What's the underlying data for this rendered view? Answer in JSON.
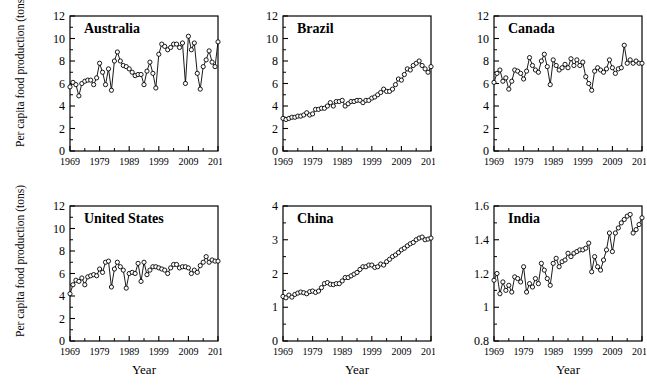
{
  "figure": {
    "type": "multi-panel-line-chart",
    "rows": 2,
    "cols": 3,
    "shared_ylabel": "Per capita food production (tons)",
    "shared_xlabel": "Year",
    "marker": "open-circle",
    "line_color": "#000000",
    "marker_fill": "#ffffff",
    "background": "#ffffff"
  },
  "chart_data": [
    {
      "type": "line",
      "title": "Australia",
      "xlabel": "Year",
      "ylabel": "Per capita food production (tons)",
      "xlim": [
        1969,
        2019
      ],
      "ylim": [
        0,
        12
      ],
      "yticks": [
        0,
        2,
        4,
        6,
        8,
        10,
        12
      ],
      "xticks": [
        1969,
        1979,
        1989,
        1999,
        2009,
        2019
      ],
      "xtick_labels": [
        "1969",
        "1979",
        "1989",
        "1999",
        "2009",
        "2019"
      ],
      "ytick_labels": [
        "0",
        "2",
        "4",
        "6",
        "8",
        "10",
        "12"
      ],
      "grid": false,
      "legend": "none",
      "x": [
        1969,
        1970,
        1971,
        1972,
        1973,
        1974,
        1975,
        1976,
        1977,
        1978,
        1979,
        1980,
        1981,
        1982,
        1983,
        1984,
        1985,
        1986,
        1987,
        1988,
        1989,
        1990,
        1991,
        1992,
        1993,
        1994,
        1995,
        1996,
        1997,
        1998,
        1999,
        2000,
        2001,
        2002,
        2003,
        2004,
        2005,
        2006,
        2007,
        2008,
        2009,
        2010,
        2011,
        2012,
        2013,
        2014,
        2015,
        2016,
        2017,
        2018,
        2019
      ],
      "values": [
        5.7,
        6.1,
        5.9,
        4.9,
        6.0,
        6.2,
        6.3,
        6.3,
        5.9,
        6.5,
        7.8,
        7.0,
        5.9,
        7.3,
        5.4,
        8.0,
        8.8,
        8.0,
        7.6,
        7.5,
        7.3,
        7.0,
        6.7,
        6.8,
        6.8,
        5.9,
        7.1,
        7.9,
        6.9,
        5.6,
        8.6,
        9.5,
        9.3,
        9.0,
        9.2,
        9.5,
        9.5,
        9.2,
        9.6,
        6.0,
        10.2,
        9.0,
        9.6,
        6.9,
        5.5,
        7.5,
        8.1,
        8.9,
        7.9,
        7.5,
        9.7
      ]
    },
    {
      "type": "line",
      "title": "Brazil",
      "xlabel": "Year",
      "ylabel": "Per capita food production (tons)",
      "xlim": [
        1969,
        2019
      ],
      "ylim": [
        0,
        12
      ],
      "yticks": [
        0,
        2,
        4,
        6,
        8,
        10,
        12
      ],
      "xticks": [
        1969,
        1979,
        1989,
        1999,
        2009,
        2019
      ],
      "xtick_labels": [
        "1969",
        "1979",
        "1989",
        "1999",
        "2009",
        "2019"
      ],
      "ytick_labels": [
        "0",
        "2",
        "4",
        "6",
        "8",
        "10",
        "12"
      ],
      "grid": false,
      "legend": "none",
      "x": [
        1969,
        1970,
        1971,
        1972,
        1973,
        1974,
        1975,
        1976,
        1977,
        1978,
        1979,
        1980,
        1981,
        1982,
        1983,
        1984,
        1985,
        1986,
        1987,
        1988,
        1989,
        1990,
        1991,
        1992,
        1993,
        1994,
        1995,
        1996,
        1997,
        1998,
        1999,
        2000,
        2001,
        2002,
        2003,
        2004,
        2005,
        2006,
        2007,
        2008,
        2009,
        2010,
        2011,
        2012,
        2013,
        2014,
        2015,
        2016,
        2017,
        2018,
        2019
      ],
      "values": [
        2.9,
        2.8,
        2.9,
        3.0,
        3.0,
        3.1,
        3.1,
        3.2,
        3.4,
        3.2,
        3.3,
        3.7,
        3.7,
        3.8,
        3.8,
        4.0,
        4.3,
        4.0,
        4.4,
        4.4,
        4.5,
        4.0,
        4.2,
        4.4,
        4.4,
        4.5,
        4.5,
        4.3,
        4.5,
        4.5,
        4.7,
        4.8,
        5.0,
        5.2,
        5.5,
        5.3,
        5.3,
        5.5,
        5.9,
        6.4,
        6.3,
        6.8,
        7.3,
        7.2,
        7.6,
        7.8,
        8.0,
        7.6,
        7.3,
        7.0,
        7.5
      ]
    },
    {
      "type": "line",
      "title": "Canada",
      "xlabel": "Year",
      "ylabel": "Per capita food production (tons)",
      "xlim": [
        1969,
        2019
      ],
      "ylim": [
        0,
        12
      ],
      "yticks": [
        0,
        2,
        4,
        6,
        8,
        10,
        12
      ],
      "xticks": [
        1969,
        1979,
        1989,
        1999,
        2009,
        2019
      ],
      "xtick_labels": [
        "1969",
        "1979",
        "1989",
        "1999",
        "2009",
        "2019"
      ],
      "ytick_labels": [
        "0",
        "2",
        "4",
        "6",
        "8",
        "10",
        "12"
      ],
      "grid": false,
      "legend": "none",
      "x": [
        1969,
        1970,
        1971,
        1972,
        1973,
        1974,
        1975,
        1976,
        1977,
        1978,
        1979,
        1980,
        1981,
        1982,
        1983,
        1984,
        1985,
        1986,
        1987,
        1988,
        1989,
        1990,
        1991,
        1992,
        1993,
        1994,
        1995,
        1996,
        1997,
        1998,
        1999,
        2000,
        2001,
        2002,
        2003,
        2004,
        2005,
        2006,
        2007,
        2008,
        2009,
        2010,
        2011,
        2012,
        2013,
        2014,
        2015,
        2016,
        2017,
        2018,
        2019
      ],
      "values": [
        6.1,
        6.9,
        7.2,
        6.2,
        6.5,
        5.5,
        6.2,
        7.2,
        7.1,
        6.9,
        6.4,
        7.1,
        8.3,
        7.6,
        7.2,
        7.0,
        8.0,
        8.6,
        7.5,
        5.9,
        8.1,
        7.6,
        7.2,
        7.4,
        7.7,
        7.4,
        8.2,
        7.6,
        8.1,
        7.6,
        7.9,
        6.6,
        6.0,
        5.4,
        7.1,
        7.4,
        7.2,
        7.0,
        7.3,
        8.1,
        7.4,
        6.9,
        7.3,
        7.4,
        9.4,
        7.8,
        8.1,
        7.8,
        8.0,
        7.8,
        7.8
      ]
    },
    {
      "type": "line",
      "title": "United States",
      "xlabel": "Year",
      "ylabel": "Per capita food production (tons)",
      "xlim": [
        1969,
        2019
      ],
      "ylim": [
        0,
        12
      ],
      "yticks": [
        0,
        2,
        4,
        6,
        8,
        10,
        12
      ],
      "xticks": [
        1969,
        1979,
        1989,
        1999,
        2009,
        2019
      ],
      "xtick_labels": [
        "1969",
        "1979",
        "1989",
        "1999",
        "2009",
        "2019"
      ],
      "ytick_labels": [
        "0",
        "2",
        "4",
        "6",
        "8",
        "10",
        "12"
      ],
      "grid": false,
      "legend": "none",
      "x": [
        1969,
        1970,
        1971,
        1972,
        1973,
        1974,
        1975,
        1976,
        1977,
        1978,
        1979,
        1980,
        1981,
        1982,
        1983,
        1984,
        1985,
        1986,
        1987,
        1988,
        1989,
        1990,
        1991,
        1992,
        1993,
        1994,
        1995,
        1996,
        1997,
        1998,
        1999,
        2000,
        2001,
        2002,
        2003,
        2004,
        2005,
        2006,
        2007,
        2008,
        2009,
        2010,
        2011,
        2012,
        2013,
        2014,
        2015,
        2016,
        2017,
        2018,
        2019
      ],
      "values": [
        4.2,
        5.0,
        5.4,
        5.3,
        5.6,
        5.0,
        5.7,
        5.8,
        5.9,
        5.8,
        6.4,
        6.1,
        7.0,
        7.1,
        4.8,
        6.4,
        7.0,
        6.6,
        6.3,
        4.7,
        6.0,
        6.1,
        6.0,
        6.9,
        5.3,
        7.0,
        5.9,
        6.3,
        6.6,
        6.6,
        6.5,
        6.4,
        6.3,
        6.0,
        6.5,
        6.8,
        6.8,
        6.5,
        6.6,
        6.6,
        6.5,
        6.0,
        6.3,
        6.1,
        6.7,
        7.0,
        7.5,
        7.0,
        7.2,
        7.1,
        7.1
      ]
    },
    {
      "type": "line",
      "title": "China",
      "xlabel": "Year",
      "ylabel": "Per capita food production (tons)",
      "xlim": [
        1969,
        2019
      ],
      "ylim": [
        0,
        4
      ],
      "yticks": [
        0,
        1,
        2,
        3,
        4
      ],
      "xticks": [
        1969,
        1979,
        1989,
        1999,
        2009,
        2019
      ],
      "xtick_labels": [
        "1969",
        "1979",
        "1989",
        "1999",
        "2009",
        "2019"
      ],
      "ytick_labels": [
        "0",
        "1",
        "2",
        "3",
        "4"
      ],
      "grid": false,
      "legend": "none",
      "x": [
        1969,
        1970,
        1971,
        1972,
        1973,
        1974,
        1975,
        1976,
        1977,
        1978,
        1979,
        1980,
        1981,
        1982,
        1983,
        1984,
        1985,
        1986,
        1987,
        1988,
        1989,
        1990,
        1991,
        1992,
        1993,
        1994,
        1995,
        1996,
        1997,
        1998,
        1999,
        2000,
        2001,
        2002,
        2003,
        2004,
        2005,
        2006,
        2007,
        2008,
        2009,
        2010,
        2011,
        2012,
        2013,
        2014,
        2015,
        2016,
        2017,
        2018,
        2019
      ],
      "values": [
        1.32,
        1.28,
        1.36,
        1.3,
        1.38,
        1.42,
        1.45,
        1.43,
        1.4,
        1.46,
        1.48,
        1.44,
        1.48,
        1.58,
        1.7,
        1.73,
        1.68,
        1.67,
        1.7,
        1.7,
        1.78,
        1.88,
        1.88,
        1.93,
        1.98,
        2.03,
        2.12,
        2.2,
        2.2,
        2.25,
        2.25,
        2.18,
        2.2,
        2.28,
        2.25,
        2.35,
        2.42,
        2.5,
        2.55,
        2.62,
        2.7,
        2.75,
        2.82,
        2.88,
        2.92,
        3.0,
        3.05,
        3.08,
        3.0,
        3.02,
        3.05
      ]
    },
    {
      "type": "line",
      "title": "India",
      "xlabel": "Year",
      "ylabel": "Per capita food production (tons)",
      "xlim": [
        1969,
        2019
      ],
      "ylim": [
        0.8,
        1.6
      ],
      "yticks": [
        0.8,
        1.0,
        1.2,
        1.4,
        1.6
      ],
      "xticks": [
        1969,
        1979,
        1989,
        1999,
        2009,
        2019
      ],
      "xtick_labels": [
        "1969",
        "1979",
        "1989",
        "1999",
        "2009",
        "2019"
      ],
      "ytick_labels": [
        "0.8",
        "1",
        "1.2",
        "1.4",
        "1.6"
      ],
      "grid": false,
      "legend": "none",
      "x": [
        1969,
        1970,
        1971,
        1972,
        1973,
        1974,
        1975,
        1976,
        1977,
        1978,
        1979,
        1980,
        1981,
        1982,
        1983,
        1984,
        1985,
        1986,
        1987,
        1988,
        1989,
        1990,
        1991,
        1992,
        1993,
        1994,
        1995,
        1996,
        1997,
        1998,
        1999,
        2000,
        2001,
        2002,
        2003,
        2004,
        2005,
        2006,
        2007,
        2008,
        2009,
        2010,
        2011,
        2012,
        2013,
        2014,
        2015,
        2016,
        2017,
        2018,
        2019
      ],
      "values": [
        1.16,
        1.2,
        1.08,
        1.15,
        1.1,
        1.13,
        1.09,
        1.18,
        1.17,
        1.15,
        1.24,
        1.09,
        1.14,
        1.12,
        1.17,
        1.14,
        1.26,
        1.22,
        1.17,
        1.13,
        1.26,
        1.29,
        1.24,
        1.27,
        1.28,
        1.32,
        1.3,
        1.32,
        1.33,
        1.34,
        1.34,
        1.35,
        1.38,
        1.21,
        1.3,
        1.24,
        1.22,
        1.28,
        1.34,
        1.44,
        1.33,
        1.44,
        1.47,
        1.5,
        1.52,
        1.54,
        1.55,
        1.44,
        1.46,
        1.49,
        1.53
      ]
    }
  ]
}
